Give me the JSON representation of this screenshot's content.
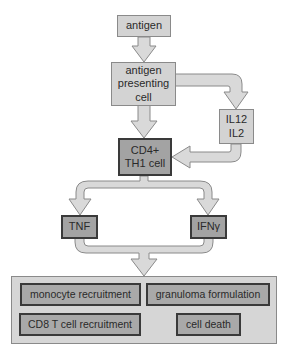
{
  "nodes": {
    "antigen": "antigen",
    "apc_line1": "antigen",
    "apc_line2": "presenting",
    "apc_line3": "cell",
    "il_line1": "IL12",
    "il_line2": "IL2",
    "cd4_line1": "CD4+",
    "cd4_line2": "TH1 cell",
    "tnf": "TNF",
    "ifn": "IFNγ"
  },
  "outcomes": {
    "monocyte": "monocyte recruitment",
    "granuloma": "granuloma formulation",
    "cd8": "CD8 T cell recruitment",
    "cell_death": "cell death"
  },
  "colors": {
    "arrow_fill": "#d8d8d8",
    "arrow_stroke": "#8a8a8a",
    "light_box": "#d3d3d3",
    "dark_box": "#a3a3a3"
  }
}
